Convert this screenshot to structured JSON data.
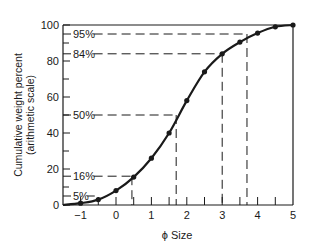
{
  "chart_data": {
    "type": "line",
    "title": "",
    "xlabel": "ϕ Size",
    "ylabel_line1": "Cumulative weight percent",
    "ylabel_line2": "(arithmetic scale)",
    "xlim": [
      -1.5,
      5
    ],
    "ylim": [
      0,
      100
    ],
    "x_ticks": [
      -1,
      0,
      1,
      2,
      3,
      4,
      5
    ],
    "x_tick_labels": [
      "−1",
      "0",
      "1",
      "2",
      "3",
      "4",
      "5"
    ],
    "x_minor_ticks": [
      -0.5,
      0.5,
      1.5,
      2.5,
      3.5,
      4.5
    ],
    "y_ticks": [
      0,
      20,
      40,
      60,
      80,
      100
    ],
    "y_tick_labels": [
      "0",
      "20",
      "40",
      "60",
      "80",
      "100"
    ],
    "y_minor_ticks": [
      10,
      30,
      50,
      70,
      90
    ],
    "grid": false,
    "legend": null,
    "series": [
      {
        "name": "Cumulative curve",
        "x": [
          -1.5,
          -1,
          -0.5,
          0,
          0.5,
          1,
          1.5,
          2,
          2.5,
          3,
          3.5,
          4,
          4.5,
          5
        ],
        "y": [
          0,
          1,
          3,
          8,
          15.5,
          26,
          40,
          58,
          74,
          84,
          90.5,
          95.5,
          99,
          100
        ],
        "markers_at": [
          -1,
          -0.5,
          0,
          0.5,
          1,
          1.5,
          2,
          2.5,
          3,
          3.5,
          4,
          4.5,
          5
        ]
      }
    ],
    "annotations": [
      {
        "label": "95%",
        "y": 95,
        "x_intercept": 3.7
      },
      {
        "label": "84%",
        "y": 84,
        "x_intercept": 3.0
      },
      {
        "label": "50%",
        "y": 50,
        "x_intercept": 1.7
      },
      {
        "label": "16%",
        "y": 16,
        "x_intercept": 0.45
      },
      {
        "label": "5%",
        "y": 5,
        "x_intercept": -0.6
      }
    ]
  },
  "colors": {
    "ink": "#1a1a1a",
    "background": "#ffffff"
  }
}
